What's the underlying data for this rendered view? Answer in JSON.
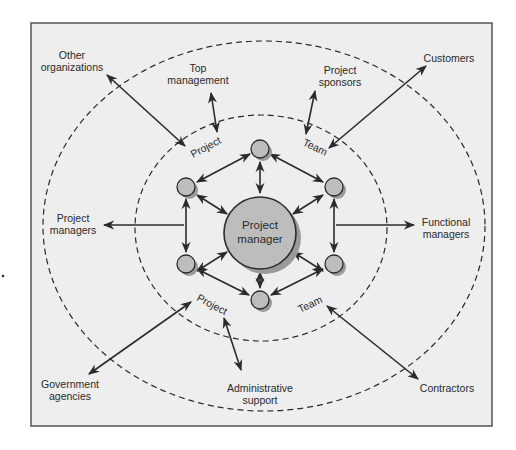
{
  "diagram": {
    "center": {
      "line1": "Project",
      "line2": "manager"
    },
    "inner_ring_labels": {
      "top_left": "Project",
      "top_right": "Team",
      "bottom_left": "Project",
      "bottom_right": "Team"
    },
    "stakeholders": {
      "other_organizations": {
        "line1": "Other",
        "line2": "organizations"
      },
      "top_management": {
        "line1": "Top",
        "line2": "management"
      },
      "project_sponsors": {
        "line1": "Project",
        "line2": "sponsors"
      },
      "customers": {
        "line1": "Customers"
      },
      "project_managers": {
        "line1": "Project",
        "line2": "managers"
      },
      "functional_managers": {
        "line1": "Functional",
        "line2": "managers"
      },
      "government_agencies": {
        "line1": "Government",
        "line2": "agencies"
      },
      "administrative_support": {
        "line1": "Administrative",
        "line2": "support"
      },
      "contractors": {
        "line1": "Contractors"
      }
    },
    "colors": {
      "frame_bg": "#eeeeee",
      "frame_border": "#555555",
      "node_fill": "#bdbdbd",
      "node_shadow": "#9a9a9a",
      "line": "#2b2b2b"
    }
  }
}
